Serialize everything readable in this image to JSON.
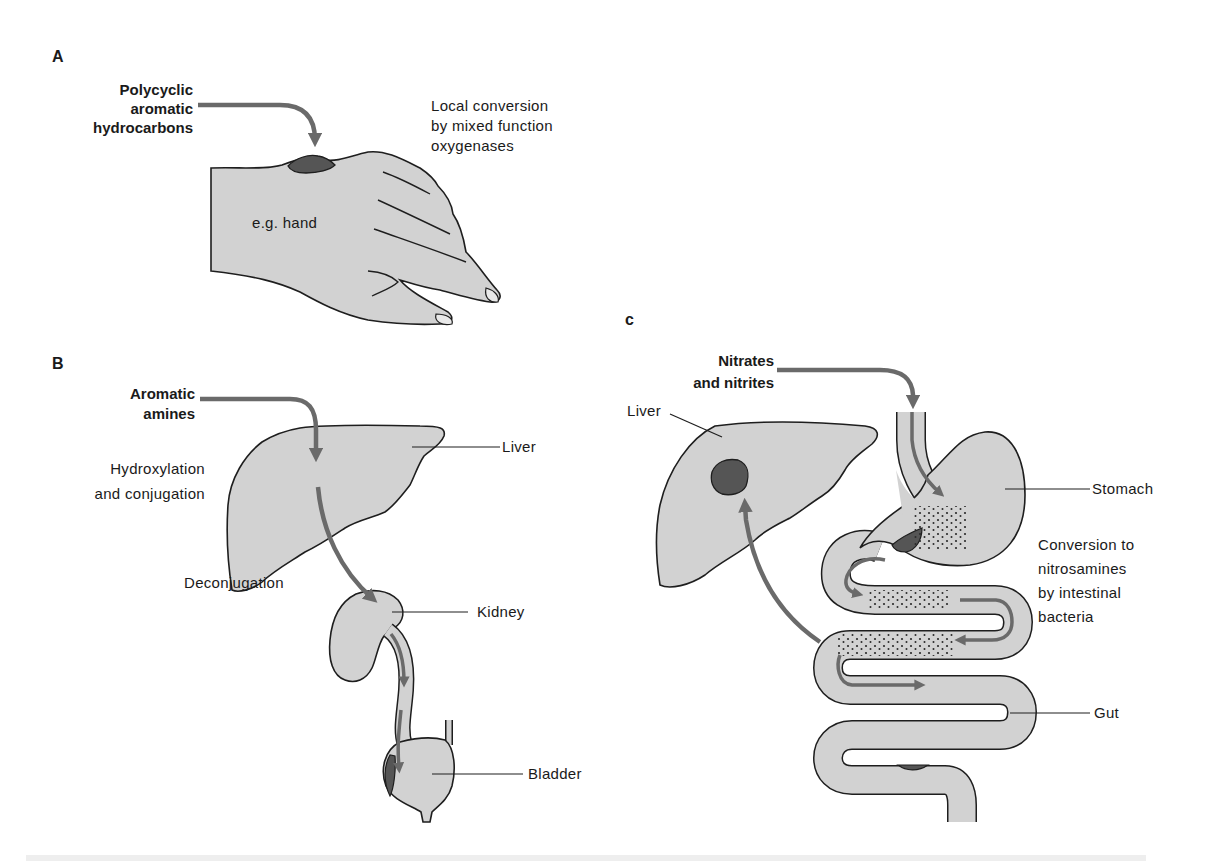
{
  "colors": {
    "tissue_fill": "#d2d2d2",
    "outline": "#1e1e1e",
    "lesion": "#555555",
    "arrow": "#6a6a6a",
    "dots": "#2a2a2a"
  },
  "panels": [
    {
      "id": "A",
      "letter": "A",
      "agent": "Polycyclic\naromatic\nhydrocarbons",
      "process": "Local conversion\nby mixed function\noxygenases",
      "organ_label": "e.g. hand"
    },
    {
      "id": "B",
      "letter": "B",
      "agent": "Aromatic\namines",
      "step_1": "Hydroxylation\nand conjugation",
      "step_2": "Deconjugation",
      "organs": [
        "Liver",
        "Kidney",
        "Bladder"
      ]
    },
    {
      "id": "C",
      "letter": "c",
      "agent": "Nitrates\nand nitrites",
      "process": "Conversion to\nnitrosamines\nby intestinal\nbacteria",
      "organs": [
        "Liver",
        "Stomach",
        "Gut"
      ]
    }
  ]
}
